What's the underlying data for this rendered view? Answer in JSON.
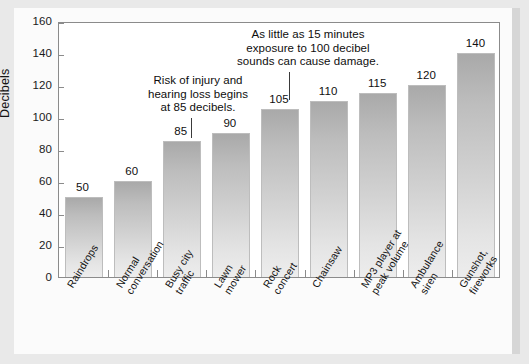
{
  "chart_data": {
    "type": "bar",
    "title": "",
    "xlabel": "",
    "ylabel": "Decibels",
    "ylim": [
      0,
      160
    ],
    "ytick_step": 20,
    "grid": false,
    "legend": "none",
    "orientation": "vertical",
    "bar_color_top": "#a9a9a9",
    "bar_color_bottom": "#ededed",
    "categories": [
      "Raindrops",
      "Normal conversation",
      "Busy city traffic",
      "Lawn mower",
      "Rock concert",
      "Chainsaw",
      "MP3 player at peak volume",
      "Ambulance siren",
      "Gunshot, fireworks"
    ],
    "values": [
      50,
      60,
      85,
      90,
      105,
      110,
      115,
      120,
      140
    ],
    "ytick_labels": [
      "0",
      "20",
      "40",
      "60",
      "80",
      "100",
      "120",
      "140",
      "160"
    ],
    "annotations": [
      {
        "text": "Risk of injury and\nhearing loss begins\nat 85 decibels.",
        "points_to_category": "Busy city traffic",
        "points_to_value": 85
      },
      {
        "text": "As little as 15 minutes\nexposure to 100 decibel\nsounds can cause damage.",
        "points_to_category": "Rock concert",
        "points_to_value": 105
      }
    ]
  },
  "category_label_lines": [
    [
      "Raindrops"
    ],
    [
      "Normal",
      "conversation"
    ],
    [
      "Busy city",
      "traffic"
    ],
    [
      "Lawn",
      "mower"
    ],
    [
      "Rock",
      "concert"
    ],
    [
      "Chainsaw"
    ],
    [
      "MP3 player at",
      "peak volume"
    ],
    [
      "Ambulance",
      "siren"
    ],
    [
      "Gunshot,",
      "fireworks"
    ]
  ]
}
